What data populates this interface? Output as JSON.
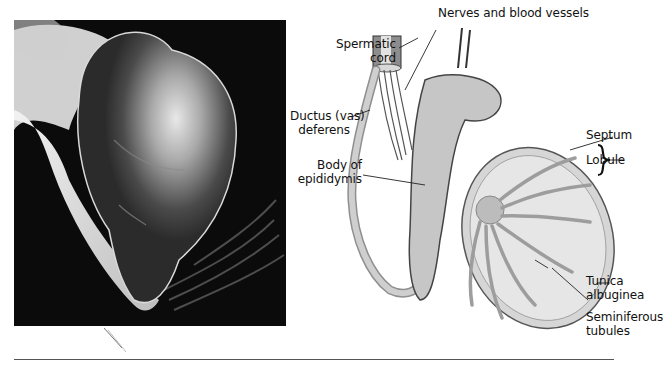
{
  "figure": {
    "photo": {
      "description": "Photograph of dissected testis and epididymis on dark background"
    },
    "diagram": {
      "description": "Illustration of testis in sagittal section with spermatic cord and epididymis",
      "labels": {
        "nerves_vessels": "Nerves and blood vessels",
        "spermatic_cord_1": "Spermatic",
        "spermatic_cord_2": "cord",
        "ductus_1": "Ductus (vas)",
        "ductus_2": "deferens",
        "body_epididymis_1": "Body of",
        "body_epididymis_2": "epididymis",
        "septum": "Septum",
        "lobule": "Lobule",
        "tunica_1": "Tunica",
        "tunica_2": "albuginea",
        "seminiferous_1": "Seminiferous",
        "seminiferous_2": "tubules"
      }
    },
    "colors": {
      "photo_bg": "#0b0b0b",
      "tissue": "#c9c9c9",
      "label_text": "#111111",
      "rule": "#555555"
    }
  }
}
